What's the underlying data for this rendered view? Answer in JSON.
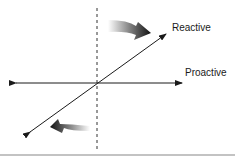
{
  "diagram": {
    "labels": {
      "reactive": "Reactive",
      "proactive": "Proactive"
    },
    "colors": {
      "line": "#1a1a1a",
      "rule": "#888888",
      "arrow_dark": "#111111"
    }
  }
}
